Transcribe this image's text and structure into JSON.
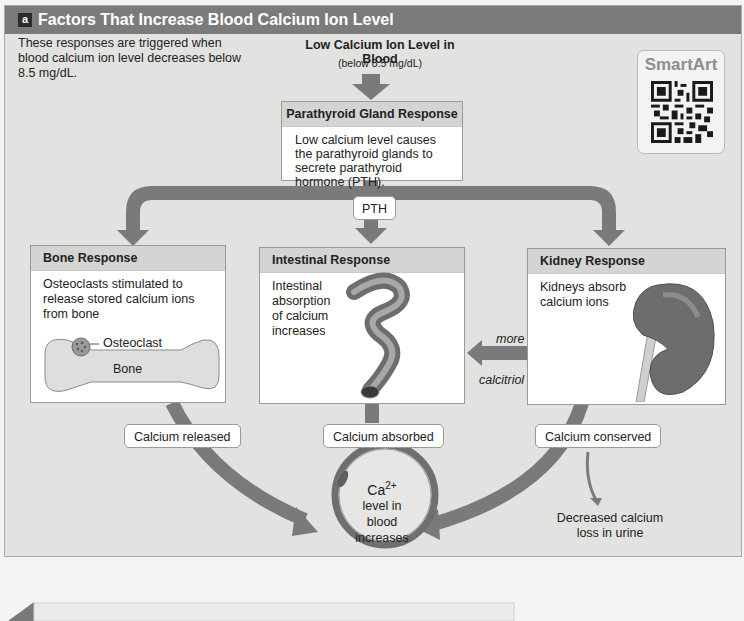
{
  "header": {
    "badge": "a",
    "title": "Factors That Increase Blood Calcium Ion Level"
  },
  "intro_text": "These responses are triggered when blood calcium ion level decreases below 8.5 mg/dL.",
  "trigger": {
    "title": "Low Calcium Ion Level in Blood",
    "subtitle": "(below 8.5 mg/dL)"
  },
  "smartart": {
    "label": "SmartArt",
    "icon": "qr-code-icon"
  },
  "parathyroid": {
    "title": "Parathyroid Gland Response",
    "body": "Low calcium level causes the parathyroid glands to secrete parathyroid hormone (PTH)."
  },
  "hormone_tag": "PTH",
  "responses": [
    {
      "id": "bone",
      "title": "Bone Response",
      "body": "Osteoclasts stimulated to release stored calcium ions from bone",
      "labels": {
        "osteoclast": "Osteoclast",
        "bone": "Bone"
      },
      "outcome": "Calcium released"
    },
    {
      "id": "intestinal",
      "title": "Intestinal Response",
      "body": "Intestinal absorption of calcium increases",
      "outcome": "Calcium absorbed"
    },
    {
      "id": "kidney",
      "title": "Kidney Response",
      "body": "Kidneys absorb calcium ions",
      "outcome": "Calcium conserved"
    }
  ],
  "calcitriol_arrow": {
    "top_label": "more",
    "bottom_label": "calcitriol"
  },
  "urine_note": "Decreased calcium loss in urine",
  "result": {
    "symbol": "Ca",
    "superscript": "2+",
    "text_line1": "level in",
    "text_line2": "blood",
    "text_line3": "increases"
  },
  "colors": {
    "arrow": "#7a7a7a",
    "panel_bg": "#e2e2e0",
    "header_bg": "#7b7b7b",
    "box_header_bg": "#d4d4d2"
  }
}
